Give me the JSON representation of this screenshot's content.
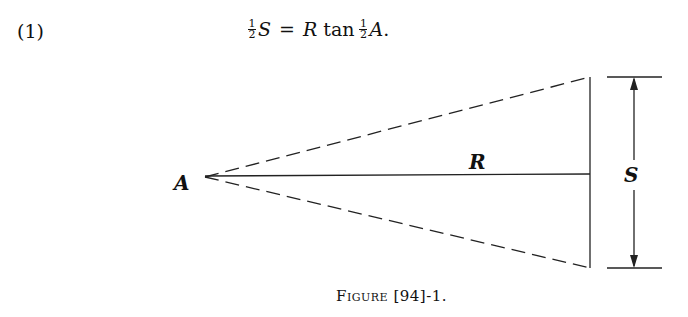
{
  "equation": {
    "number": "(1)",
    "lhs_frac_num": "1",
    "lhs_frac_den": "2",
    "lhs_var": "S",
    "equals": "=",
    "rhs_var": "R",
    "rhs_func": "tan",
    "rhs_frac_num": "1",
    "rhs_frac_den": "2",
    "rhs_angle": "A",
    "period": "."
  },
  "figure": {
    "labels": {
      "vertex": "A",
      "radius": "R",
      "span": "S"
    },
    "caption": "Figure [94]-1."
  }
}
